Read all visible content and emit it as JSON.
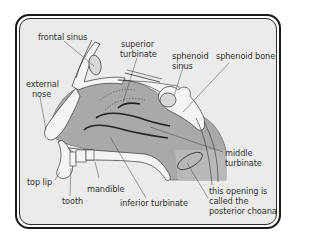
{
  "diagram": {
    "type": "anatomical-cross-section",
    "colors": {
      "background": "#ebebeb",
      "cavity": "#a8a8a8",
      "bone": "#f4f4f4",
      "outline": "#2a2a2a",
      "label_text": "#333333"
    },
    "labels": {
      "frontal_sinus": "frontal sinus",
      "superior_turbinate_1": "superior",
      "superior_turbinate_2": "turbinate",
      "sphenoid_sinus_1": "sphenoid",
      "sphenoid_sinus_2": "sinus",
      "sphenoid_bone": "sphenoid bone",
      "external_nose_1": "external",
      "external_nose_2": "nose",
      "middle_turbinate_1": "middle",
      "middle_turbinate_2": "turbinate",
      "top_lip": "top lip",
      "mandible": "mandible",
      "tooth": "tooth",
      "inferior_turbinate": "inferior turbinate",
      "posterior_choana_1": "this opening is",
      "posterior_choana_2": "called the",
      "posterior_choana_3": "posterior choana"
    }
  }
}
